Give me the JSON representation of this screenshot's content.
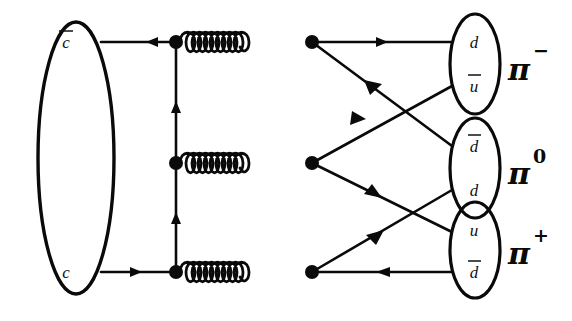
{
  "diagram": {
    "type": "feynman-diagram",
    "background_color": "#ffffff",
    "ink_color": "#0a0a0a",
    "initial_state": {
      "name": "charm-meson-blob",
      "quarks": [
        {
          "id": "cbar",
          "label": "c",
          "overline": true,
          "y": 42
        },
        {
          "id": "c",
          "label": "c",
          "overline": false,
          "y": 272
        }
      ]
    },
    "final_state": {
      "pions": [
        {
          "id": "pi-minus",
          "symbol": "π",
          "charge": "−",
          "quarks": [
            {
              "id": "d-top",
              "label": "d",
              "overline": false
            },
            {
              "id": "ubar-top",
              "label": "u",
              "overline": true
            }
          ]
        },
        {
          "id": "pi-zero",
          "symbol": "π",
          "charge": "0",
          "quarks": [
            {
              "id": "dbar-mid",
              "label": "d",
              "overline": true
            },
            {
              "id": "d-mid",
              "label": "d",
              "overline": false
            }
          ]
        },
        {
          "id": "pi-plus",
          "symbol": "π",
          "charge": "+",
          "quarks": [
            {
              "id": "u-bot",
              "label": "u",
              "overline": false
            },
            {
              "id": "dbar-bot",
              "label": "d",
              "overline": true
            }
          ]
        }
      ]
    },
    "propagators": {
      "gluons": [
        {
          "id": "gluon-top",
          "y": 42,
          "x1": 176,
          "x2": 312,
          "loops": 9
        },
        {
          "id": "gluon-middle",
          "y": 163,
          "x1": 176,
          "x2": 312,
          "loops": 9
        },
        {
          "id": "gluon-bottom",
          "y": 272,
          "x1": 176,
          "x2": 312,
          "loops": 9
        }
      ],
      "quark_vertical": [
        {
          "id": "quark-rung-upper",
          "x": 176,
          "y1": 272,
          "y2": 163,
          "direction": "up"
        },
        {
          "id": "quark-rung-lower",
          "x": 176,
          "y1": 163,
          "y2": 42,
          "direction": "up"
        }
      ]
    },
    "vertices": [
      {
        "id": "vertex-top-left",
        "x": 176,
        "y": 42
      },
      {
        "id": "vertex-top-right",
        "x": 312,
        "y": 42
      },
      {
        "id": "vertex-mid-left",
        "x": 176,
        "y": 163
      },
      {
        "id": "vertex-mid-right",
        "x": 312,
        "y": 163
      },
      {
        "id": "vertex-bot-left",
        "x": 176,
        "y": 272
      },
      {
        "id": "vertex-bot-right",
        "x": 312,
        "y": 272
      }
    ],
    "fermion_lines": [
      {
        "id": "line-cbar-in",
        "from": "cbar-blob",
        "to": "vertex-top-left",
        "arrow": "left"
      },
      {
        "id": "line-c-in",
        "from": "c-blob",
        "to": "vertex-bot-left",
        "arrow": "right"
      },
      {
        "id": "line-d-out-top",
        "from": "vertex-top-right",
        "to": "d-top",
        "arrow": "right"
      },
      {
        "id": "line-dbar-out-bot",
        "from": "dbar-bot",
        "to": "vertex-bot-right",
        "arrow": "left"
      },
      {
        "id": "line-top-to-dbar-mid",
        "from": "vertex-top-right",
        "to": "dbar-mid",
        "arrow": "down-left"
      },
      {
        "id": "line-mid-to-ubar-top",
        "from": "vertex-mid-right",
        "to": "ubar-top",
        "arrow": "up-left"
      },
      {
        "id": "line-mid-to-u-bot",
        "from": "vertex-mid-right",
        "to": "u-bot",
        "arrow": "down-right"
      },
      {
        "id": "line-bot-to-d-mid",
        "from": "vertex-bot-right",
        "to": "d-mid",
        "arrow": "up-right"
      }
    ]
  }
}
